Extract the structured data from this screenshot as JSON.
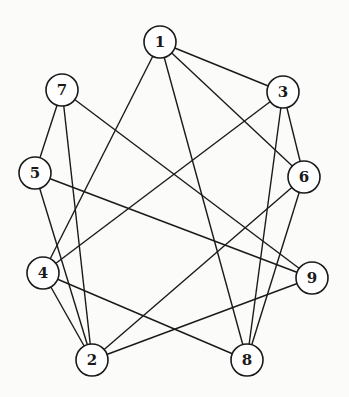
{
  "graph": {
    "type": "undirected",
    "node_radius": 16,
    "colors": {
      "stroke": "#1a1a1a",
      "node_fill": "#ffffff",
      "background": "#fbfbfa"
    },
    "nodes": [
      {
        "id": "1",
        "label": "1",
        "x": 160,
        "y": 42
      },
      {
        "id": "2",
        "label": "2",
        "x": 92,
        "y": 360
      },
      {
        "id": "3",
        "label": "3",
        "x": 283,
        "y": 92
      },
      {
        "id": "4",
        "label": "4",
        "x": 43,
        "y": 273
      },
      {
        "id": "5",
        "label": "5",
        "x": 35,
        "y": 173
      },
      {
        "id": "6",
        "label": "6",
        "x": 304,
        "y": 177
      },
      {
        "id": "7",
        "label": "7",
        "x": 62,
        "y": 90
      },
      {
        "id": "8",
        "label": "8",
        "x": 247,
        "y": 360
      },
      {
        "id": "9",
        "label": "9",
        "x": 312,
        "y": 278
      }
    ],
    "edges": [
      [
        "1",
        "3"
      ],
      [
        "1",
        "6"
      ],
      [
        "1",
        "8"
      ],
      [
        "1",
        "4"
      ],
      [
        "7",
        "5"
      ],
      [
        "7",
        "2"
      ],
      [
        "7",
        "9"
      ],
      [
        "3",
        "6"
      ],
      [
        "3",
        "8"
      ],
      [
        "3",
        "4"
      ],
      [
        "5",
        "9"
      ],
      [
        "5",
        "2"
      ],
      [
        "6",
        "8"
      ],
      [
        "6",
        "2"
      ],
      [
        "4",
        "2"
      ],
      [
        "4",
        "8"
      ],
      [
        "9",
        "2"
      ]
    ]
  }
}
